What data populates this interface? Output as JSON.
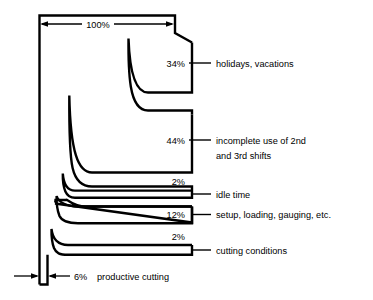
{
  "figure": {
    "title_dimension": "100%",
    "segments": [
      {
        "id": "holidays",
        "percent": "34%",
        "label_lines": [
          "holidays, vacations"
        ]
      },
      {
        "id": "incomplete-shifts",
        "percent": "44%",
        "label_lines": [
          "incomplete use of 2nd",
          "and 3rd shifts"
        ]
      },
      {
        "id": "idle-time",
        "percent": "2%",
        "label_lines": [
          "idle time"
        ]
      },
      {
        "id": "setup-loading-gauging",
        "percent": "12%",
        "label_lines": [
          "setup, loading, gauging, etc."
        ]
      },
      {
        "id": "cutting-conditions",
        "percent": "2%",
        "label_lines": [
          "cutting conditions"
        ]
      },
      {
        "id": "productive-cutting",
        "percent": "6%",
        "label_lines": [
          "productive cutting"
        ]
      }
    ],
    "colors": {
      "stroke": "#000000",
      "background": "#ffffff"
    }
  }
}
